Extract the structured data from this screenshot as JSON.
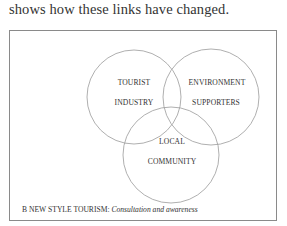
{
  "intro_text": "shows how these links have changed.",
  "diagram": {
    "circles": [
      {
        "id": "tourist-industry",
        "cx": 134,
        "cy": 97,
        "r": 47,
        "label_lines": [
          "TOURIST",
          "INDUSTRY"
        ]
      },
      {
        "id": "environment-supporters",
        "cx": 211,
        "cy": 97,
        "r": 48,
        "label_lines": [
          "ENVIRONMENT",
          "SUPPORTERS"
        ]
      },
      {
        "id": "local-community",
        "cx": 171,
        "cy": 155,
        "r": 48,
        "label_lines": [
          "LOCAL",
          "COMMUNITY"
        ]
      }
    ],
    "stroke_color": "#9a9a9a",
    "frame_color": "#8a8a8a"
  },
  "caption": {
    "prefix": "B  NEW STYLE TOURISM:",
    "italic": "Consultation and awareness"
  }
}
